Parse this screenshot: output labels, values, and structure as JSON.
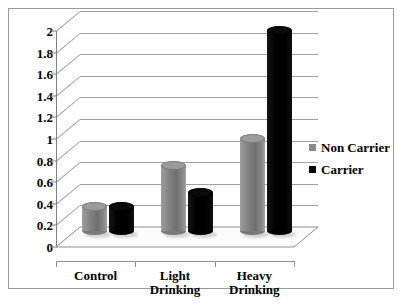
{
  "chart_data": {
    "type": "bar",
    "title": "",
    "xlabel": "",
    "ylabel": "",
    "ylim": [
      0,
      2
    ],
    "ytick_step": 0.2,
    "grid": true,
    "style": "3d-cylinder",
    "legend_position": "right",
    "categories": [
      "Control",
      "Light\nDrinking",
      "Heavy\nDrinking"
    ],
    "y_tick_labels": [
      "0",
      "0.2",
      "0.4",
      "0.6",
      "0.8",
      "1",
      "1.2",
      "1.4",
      "1.6",
      "1.8",
      "2"
    ],
    "series": [
      {
        "name": "Non Carrier",
        "color": "#8a8a8a",
        "values": [
          0.22,
          0.6,
          0.85
        ]
      },
      {
        "name": "Carrier",
        "color": "#000000",
        "values": [
          0.22,
          0.35,
          1.85
        ]
      }
    ]
  },
  "legend": {
    "items": [
      {
        "label": "Non Carrier",
        "color": "#8a8a8a"
      },
      {
        "label": "Carrier",
        "color": "#000000"
      }
    ]
  }
}
